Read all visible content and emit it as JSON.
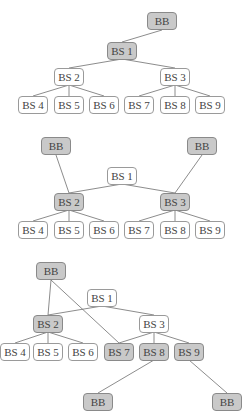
{
  "colors": {
    "shaded_fill": "#c9c9c9",
    "plain_fill": "#ffffff",
    "border": "#9a9a9a",
    "edge": "#6e6e6e"
  },
  "diagrams": [
    {
      "nodes": {
        "bb": "BB",
        "bs1": "BS 1",
        "bs2": "BS 2",
        "bs3": "BS 3",
        "bs4": "BS 4",
        "bs5": "BS 5",
        "bs6": "BS 6",
        "bs7": "BS 7",
        "bs8": "BS 8",
        "bs9": "BS 9"
      },
      "shaded": [
        "bb",
        "bs1"
      ]
    },
    {
      "nodes": {
        "bb_left": "BB",
        "bb_right": "BB",
        "bs1": "BS 1",
        "bs2": "BS 2",
        "bs3": "BS 3",
        "bs4": "BS 4",
        "bs5": "BS 5",
        "bs6": "BS 6",
        "bs7": "BS 7",
        "bs8": "BS 8",
        "bs9": "BS 9"
      },
      "shaded": [
        "bb_left",
        "bb_right",
        "bs2",
        "bs3"
      ]
    },
    {
      "nodes": {
        "bb_top": "BB",
        "bs1": "BS 1",
        "bs2": "BS 2",
        "bs3": "BS 3",
        "bs4": "BS 4",
        "bs5": "BS 5",
        "bs6": "BS 6",
        "bs7": "BS 7",
        "bs8": "BS 8",
        "bs9": "BS 9",
        "bb_bottom_left": "BB",
        "bb_bottom_right": "BB"
      },
      "shaded": [
        "bb_top",
        "bs2",
        "bs7",
        "bs8",
        "bs9",
        "bb_bottom_left",
        "bb_bottom_right"
      ]
    }
  ]
}
